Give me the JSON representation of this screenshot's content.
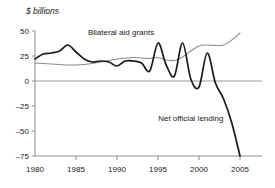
{
  "chart_data": {
    "type": "line",
    "title": "",
    "ylabel": "$ billions",
    "xlabel": "",
    "ylim": [
      -75,
      50
    ],
    "xlim": [
      1980,
      2005
    ],
    "grid": false,
    "legend_position": "inline-annotation",
    "yticks": [
      50,
      25,
      0,
      -25,
      -50,
      -75
    ],
    "ytick_labels": [
      "50",
      "25",
      "0",
      "–25",
      "–50",
      "–75"
    ],
    "xticks": [
      1980,
      1985,
      1990,
      1995,
      2000,
      2005
    ],
    "xtick_labels": [
      "1980",
      "1985",
      "1990",
      "1995",
      "2000",
      "2005"
    ],
    "zero_line": 0,
    "colors": {
      "bilateral_aid_grants": "#8c8c8c",
      "net_official_lending": "#1a1a1a",
      "axis": "#8c8c8c",
      "zero_line": "#9a9a9a"
    },
    "series": [
      {
        "name": "Bilateral aid grants",
        "color": "#8c8c8c",
        "label_x": 1990.5,
        "label_y": 44,
        "x": [
          1980,
          1981,
          1982,
          1983,
          1984,
          1985,
          1986,
          1987,
          1988,
          1989,
          1990,
          1991,
          1992,
          1993,
          1994,
          1995,
          1996,
          1997,
          1998,
          1999,
          2000,
          2001,
          2002,
          2003,
          2004,
          2005
        ],
        "values": [
          18,
          17.5,
          17,
          16.5,
          16,
          16,
          16.5,
          17.5,
          19,
          20.5,
          22,
          23,
          23.5,
          23,
          22.5,
          23.5,
          21,
          20.5,
          24,
          30,
          35,
          36,
          35.5,
          36,
          41,
          48
        ]
      },
      {
        "name": "Net official lending",
        "color": "#1a1a1a",
        "label_x": 1999.5,
        "label_y": -42,
        "x": [
          1980,
          1981,
          1982,
          1983,
          1984,
          1985,
          1986,
          1987,
          1988,
          1989,
          1990,
          1991,
          1992,
          1993,
          1994,
          1995,
          1996,
          1997,
          1998,
          1999,
          2000,
          2001,
          2002,
          2003,
          2004,
          2005
        ],
        "values": [
          22,
          27,
          28,
          30,
          36,
          29,
          22,
          19,
          20,
          19,
          15,
          20,
          20,
          18,
          10,
          38,
          16,
          5,
          38,
          2,
          -6,
          28,
          -2,
          -18,
          -42,
          -75
        ]
      }
    ],
    "annotations": [
      {
        "text": "Bilateral aid grants",
        "x": 1990.5,
        "y": 46
      },
      {
        "text": "Net official lending",
        "x": 1999.0,
        "y": -40
      }
    ]
  },
  "labels": {
    "y_axis_title": "$ billions",
    "series_1": "Bilateral aid grants",
    "series_2": "Net official lending"
  }
}
